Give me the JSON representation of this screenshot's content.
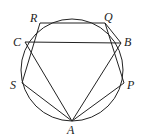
{
  "diagram": {
    "type": "geometry",
    "circle": {
      "cx": 72,
      "cy": 70,
      "r": 51
    },
    "points": {
      "R": {
        "label": "R",
        "x": 40,
        "y": 23,
        "lx": 30,
        "ly": 22
      },
      "Q": {
        "label": "Q",
        "x": 105,
        "y": 23,
        "lx": 104,
        "ly": 21
      },
      "C": {
        "label": "C",
        "x": 25,
        "y": 42,
        "lx": 13,
        "ly": 46
      },
      "B": {
        "label": "B",
        "x": 121,
        "y": 43,
        "lx": 124,
        "ly": 46
      },
      "S": {
        "label": "S",
        "x": 22,
        "y": 83,
        "lx": 10,
        "ly": 89
      },
      "P": {
        "label": "P",
        "x": 124,
        "y": 83,
        "lx": 127,
        "ly": 89
      },
      "A": {
        "label": "A",
        "x": 72,
        "y": 121,
        "lx": 67,
        "ly": 134
      }
    },
    "segments": [
      [
        "R",
        "Q"
      ],
      [
        "C",
        "B"
      ],
      [
        "Q",
        "B"
      ],
      [
        "R",
        "S"
      ],
      [
        "C",
        "A"
      ],
      [
        "S",
        "A"
      ],
      [
        "Q",
        "P"
      ],
      [
        "B",
        "A"
      ],
      [
        "P",
        "A"
      ]
    ]
  }
}
